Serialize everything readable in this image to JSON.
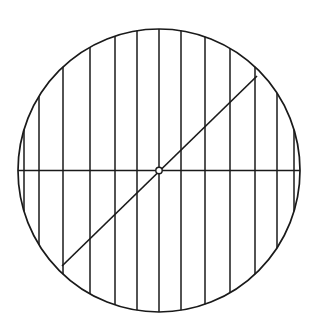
{
  "figure": {
    "background_color": "#ffffff",
    "stroke_color": "#1a1a1a",
    "canvas": {
      "width": 319,
      "height": 333
    }
  },
  "chart_data": {
    "type": "diagram",
    "subtitle": "",
    "xlabel": "",
    "ylabel": "",
    "grid": false,
    "legend": "none",
    "annotations": [],
    "geometry": {
      "shape": "ellipse",
      "center": {
        "x": 159,
        "y": 170.5
      },
      "radius_x": 141,
      "radius_y": 141.5,
      "stroke_width": 1.7,
      "stroke_color": "#1a1a1a",
      "fill": "none"
    },
    "vertical_chords": {
      "count": 13,
      "stroke_width": 1.5,
      "stroke_color": "#1a1a1a",
      "x_positions": [
        24,
        39,
        63,
        90,
        115,
        137,
        159,
        181,
        205,
        230,
        255,
        277,
        294
      ]
    },
    "horizontal_diameter": {
      "x1": 18,
      "y1": 170.5,
      "x2": 300,
      "y2": 170.5,
      "stroke_width": 1.5,
      "stroke_color": "#1a1a1a"
    },
    "diagonal_diameter": {
      "x1": 62,
      "y1": 266,
      "x2": 257,
      "y2": 76,
      "stroke_width": 1.7,
      "stroke_color": "#1a1a1a",
      "angle_degrees": 44
    },
    "center_marker": {
      "type": "open-circle",
      "x": 159,
      "y": 170.5,
      "radius": 3.2,
      "fill": "#ffffff",
      "stroke_color": "#1a1a1a",
      "stroke_width": 1.4
    }
  }
}
